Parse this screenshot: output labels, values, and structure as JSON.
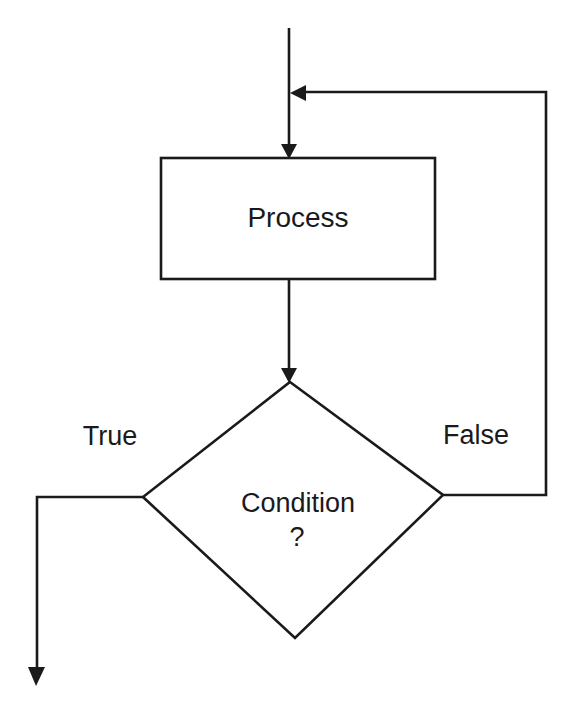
{
  "diagram": {
    "type": "flowchart",
    "nodes": {
      "process": {
        "label": "Process",
        "shape": "rectangle"
      },
      "condition": {
        "line1": "Condition",
        "line2": "?",
        "shape": "diamond"
      }
    },
    "edges": {
      "true_label": "True",
      "false_label": "False"
    },
    "colors": {
      "stroke": "#1a1a1a",
      "background": "#ffffff"
    }
  }
}
